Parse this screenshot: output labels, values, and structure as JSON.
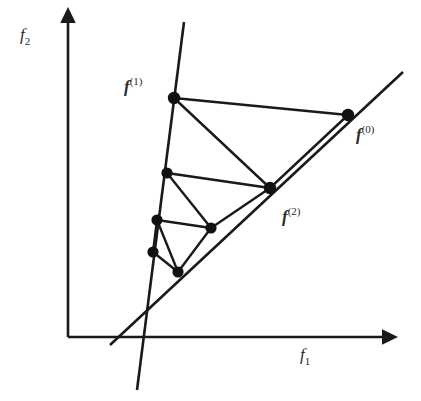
{
  "figure": {
    "background_color": "#ffffff",
    "line_color": "#1a1a1a",
    "node_color": "#111111",
    "label_color": "#2b2b2b",
    "width": 421,
    "height": 401
  },
  "axes": {
    "x": {
      "label_base": "f",
      "label_sub": "1",
      "label_full": "f1",
      "origin": [
        68,
        337
      ],
      "tip": [
        385,
        337
      ],
      "label_pos": [
        300,
        360
      ]
    },
    "y": {
      "label_base": "f",
      "label_sub": "2",
      "label_full": "f2",
      "origin": [
        68,
        337
      ],
      "tip": [
        68,
        20
      ],
      "label_pos": [
        20,
        40
      ]
    }
  },
  "constraint_lines": [
    {
      "name": "steep-line",
      "description": "steeply descending straight line through the iterate cluster",
      "from": [
        184,
        22
      ],
      "to": [
        137,
        390
      ]
    },
    {
      "name": "shallow-line",
      "description": "shallow ascending straight line passing through f(0)",
      "from": [
        110,
        345
      ],
      "to": [
        403,
        72
      ]
    }
  ],
  "points": [
    {
      "id": "p0",
      "name": "f-0",
      "label_base": "f",
      "label_sup": "(0)",
      "x": 348,
      "y": 115,
      "labeled": true,
      "label_pos": [
        356,
        140
      ]
    },
    {
      "id": "p1",
      "name": "f-1",
      "label_base": "f",
      "label_sup": "(1)",
      "x": 174,
      "y": 98,
      "labeled": true,
      "label_pos": [
        124,
        92
      ]
    },
    {
      "id": "p2",
      "name": "f-2",
      "label_base": "f",
      "label_sup": "(2)",
      "x": 270,
      "y": 188,
      "labeled": true,
      "label_pos": [
        282,
        222
      ]
    },
    {
      "id": "p3",
      "name": "f-3",
      "label_base": "f",
      "label_sup": "(3)",
      "x": 167,
      "y": 173,
      "labeled": false,
      "label_pos": [
        0,
        0
      ]
    },
    {
      "id": "p4",
      "name": "f-4",
      "label_base": "f",
      "label_sup": "(4)",
      "x": 211,
      "y": 228,
      "labeled": false,
      "label_pos": [
        0,
        0
      ]
    },
    {
      "id": "p5",
      "name": "f-5",
      "label_base": "f",
      "label_sup": "(5)",
      "x": 157,
      "y": 220,
      "labeled": false,
      "label_pos": [
        0,
        0
      ]
    },
    {
      "id": "p6",
      "name": "f-6",
      "label_base": "f",
      "label_sup": "(6)",
      "x": 178,
      "y": 272,
      "labeled": false,
      "label_pos": [
        0,
        0
      ]
    },
    {
      "id": "p7",
      "name": "f-7",
      "label_base": "f",
      "label_sup": "(7)",
      "x": 153,
      "y": 252,
      "labeled": false,
      "label_pos": [
        0,
        0
      ]
    }
  ],
  "edges": [
    {
      "name": "edge-f1-f0",
      "from": "p1",
      "to": "p0"
    },
    {
      "name": "edge-f0-f2",
      "from": "p0",
      "to": "p2"
    },
    {
      "name": "edge-f1-f2",
      "from": "p1",
      "to": "p2"
    },
    {
      "name": "edge-f2-f3",
      "from": "p2",
      "to": "p3"
    },
    {
      "name": "edge-f3-f4",
      "from": "p3",
      "to": "p4"
    },
    {
      "name": "edge-f2-f4",
      "from": "p2",
      "to": "p4"
    },
    {
      "name": "edge-f4-f5",
      "from": "p4",
      "to": "p5"
    },
    {
      "name": "edge-f5-f6",
      "from": "p5",
      "to": "p6"
    },
    {
      "name": "edge-f4-f6",
      "from": "p4",
      "to": "p6"
    },
    {
      "name": "edge-f6-f7",
      "from": "p6",
      "to": "p7"
    },
    {
      "name": "edge-f5-f7",
      "from": "p5",
      "to": "p7"
    }
  ]
}
